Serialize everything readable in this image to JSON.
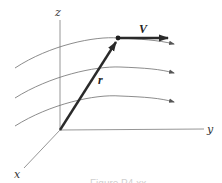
{
  "diagram": {
    "type": "3d-vector-flow-field",
    "axes": {
      "x_label": "x",
      "y_label": "y",
      "z_label": "z"
    },
    "vectors": {
      "position_label": "r",
      "velocity_label": "V"
    },
    "streamline_count": 3,
    "caption": "Figure P4.xx",
    "colors": {
      "axis": "#8a8a8a",
      "streamline": "#6e6e6e",
      "vector": "#2a2a2a",
      "caption": "#cfcfcf"
    }
  }
}
